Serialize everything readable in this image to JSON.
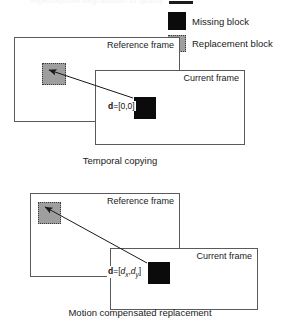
{
  "top_strip": {
    "ghost_text": "imperceptible degradation of quality"
  },
  "legend": {
    "items": [
      {
        "label": "Missing block",
        "icon": "filled-black-square-icon",
        "color": "#0b0b0b"
      },
      {
        "label": "Replacement block",
        "icon": "dotted-gray-square-icon",
        "color": "#9e9e9e"
      }
    ]
  },
  "diagrams": [
    {
      "id": "temporal-copying",
      "caption": "Temporal copying",
      "reference_frame_label": "Reference frame",
      "current_frame_label": "Current frame",
      "vector_label_html": "<b>d</b>=[0,0]",
      "vector_label_text": "d=[0,0]"
    },
    {
      "id": "motion-compensated-replacement",
      "caption": "Motion compensated replacement",
      "reference_frame_label": "Reference frame",
      "current_frame_label": "Current frame",
      "vector_label_html": "<b>d</b>=[<i>d</i><sub>x</sub>,<i>d</i><sub>y</sub>]",
      "vector_label_text": "d=[dx,dy]"
    }
  ],
  "colors": {
    "frame_border": "#5a5a5a",
    "missing_block": "#0b0b0b",
    "replacement_block": "#9e9e9e",
    "arrow": "#1a1a1a",
    "background": "#ffffff"
  }
}
